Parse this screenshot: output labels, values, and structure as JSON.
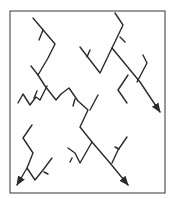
{
  "diagram": {
    "type": "branching-network",
    "frame": {
      "x": 10,
      "y": 11,
      "width": 155,
      "height": 182,
      "stroke": "#555555"
    },
    "stroke_color": "#2a2a2a",
    "stroke_width": 1.4,
    "paths": [
      {
        "id": "nw-trunk",
        "points": "33,18 55,44 48,58 38,75 45,86 56,100 61,94 69,88 78,101 88,110 80,127 92,142 110,163 128,185",
        "arrow": true
      },
      {
        "id": "nw-tick-1",
        "points": "43,30 39,40",
        "arrow": false
      },
      {
        "id": "nw-spur",
        "points": "31,66 38,75",
        "arrow": false
      },
      {
        "id": "w-zigzag",
        "points": "18,103 23,94 30,105 36,97 40,100 47,86",
        "arrow": false
      },
      {
        "id": "w-tick",
        "points": "37,91 34,98",
        "arrow": false
      },
      {
        "id": "mid-tick-1",
        "points": "75,99 73,106",
        "arrow": false
      },
      {
        "id": "mid-tick-2",
        "points": "98,95 90,110",
        "arrow": false
      },
      {
        "id": "ne-trunk",
        "points": "115,13 123,25 112,48 140,82 160,112",
        "arrow": true
      },
      {
        "id": "ne-left",
        "points": "80,47 100,73 112,48",
        "arrow": false
      },
      {
        "id": "ne-left-tick",
        "points": "90,50 87,57",
        "arrow": false
      },
      {
        "id": "ne-tick",
        "points": "120,37 125,42",
        "arrow": false
      },
      {
        "id": "ne-right",
        "points": "143,55 147,63 137,82",
        "arrow": false
      },
      {
        "id": "ne-lower",
        "points": "128,75 118,90 127,103",
        "arrow": false
      },
      {
        "id": "sw-trunk",
        "points": "32,125 23,138 33,153 27,168 17,185",
        "arrow": true
      },
      {
        "id": "sw-branch",
        "points": "27,168 35,180 43,170 52,158",
        "arrow": false
      },
      {
        "id": "sw-tick",
        "points": "44,172 48,174",
        "arrow": false
      },
      {
        "id": "s-mid",
        "points": "68,148 75,153 80,163 92,142",
        "arrow": false
      },
      {
        "id": "s-mid-tick",
        "points": "72,158 70,162",
        "arrow": false
      },
      {
        "id": "se-branch",
        "points": "127,137 118,150 112,163",
        "arrow": false
      },
      {
        "id": "se-tick",
        "points": "115,147 119,149",
        "arrow": false
      }
    ]
  }
}
